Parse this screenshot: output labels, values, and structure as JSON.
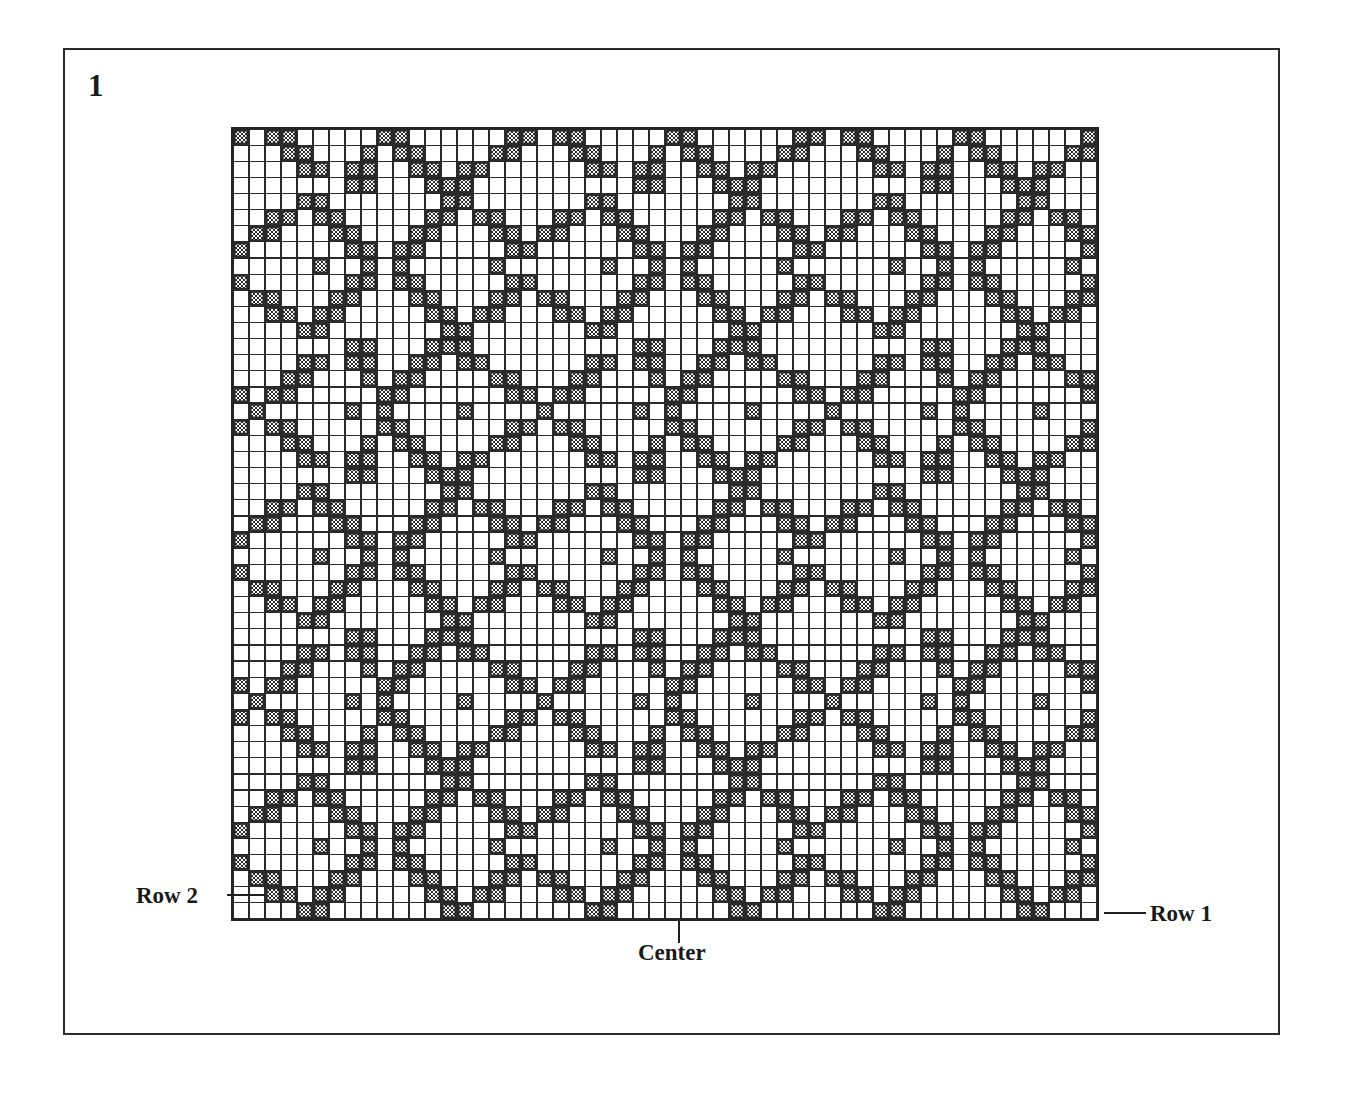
{
  "figure": {
    "number": "1"
  },
  "annotations": {
    "row2": "Row 2",
    "row1": "Row 1",
    "center": "Center"
  },
  "colors": {
    "ink": "#1a1a1a",
    "grid_line": "#232323",
    "cell_fill": "#2f2f2f",
    "background": "#ffffff",
    "frame": "#2b2b2b"
  },
  "chart_data": {
    "type": "heatmap",
    "title": "",
    "subtitle": "",
    "xlabel": "",
    "ylabel": "",
    "grid": true,
    "legend_position": "none",
    "columns": 54,
    "rows": 49,
    "cell_px": 16,
    "repeat_width": 18,
    "repeat_height": 18,
    "center_column": 28,
    "row_numbering": "from bottom; Row 1 is the bottom-most row, Row 2 is the second row from the bottom",
    "symbols": {
      "blank": "background / knit stitch",
      "filled": "pattern / purl stitch (checkered fill)"
    },
    "tick_labels": {
      "bottom_right": "Row 1",
      "bottom_left": "Row 2",
      "bottom_center": "Center"
    },
    "motif_18x18": [
      "000111000000000011",
      "001101100000011011",
      "011000011000110001",
      "110000001101100000",
      "100001000010000010",
      "110000001101100000",
      "011000011000110001",
      "001101100000011011",
      "000111000000000011",
      "000011000000011000",
      "000110110001101100",
      "001100011011000110",
      "011000001100000011",
      "010000010000001001",
      "011000001100000011",
      "001100011011000110",
      "000110110001101100",
      "000011000000011000"
    ],
    "axis_ranges": {
      "x": [
        1,
        54
      ],
      "y": [
        1,
        49
      ]
    }
  }
}
